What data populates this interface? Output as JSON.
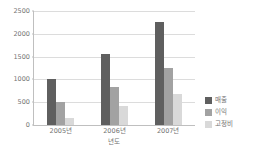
{
  "chart_data": {
    "type": "bar",
    "title": "",
    "subtitle": "",
    "xlabel": "년도",
    "ylabel": "",
    "categories": [
      "2005년",
      "2006년",
      "2007년"
    ],
    "series": [
      {
        "name": "매출",
        "values": [
          1000,
          1550,
          2270
        ],
        "color": "#5f5f5f"
      },
      {
        "name": "이익",
        "values": [
          500,
          840,
          1250
        ],
        "color": "#a2a2a2"
      },
      {
        "name": "고정비",
        "values": [
          150,
          420,
          680
        ],
        "color": "#d9d9d9"
      }
    ],
    "ylim": [
      0,
      2500
    ],
    "ytick_values": [
      0,
      500,
      1000,
      1500,
      2000,
      2500
    ],
    "ytick_labels": [
      "0",
      "500",
      "1000",
      "1500",
      "2000",
      "2500"
    ],
    "grid": true,
    "grid_axis": "y",
    "legend_position": "right",
    "legend_entries": [
      "매출",
      "이익",
      "고정비"
    ]
  }
}
